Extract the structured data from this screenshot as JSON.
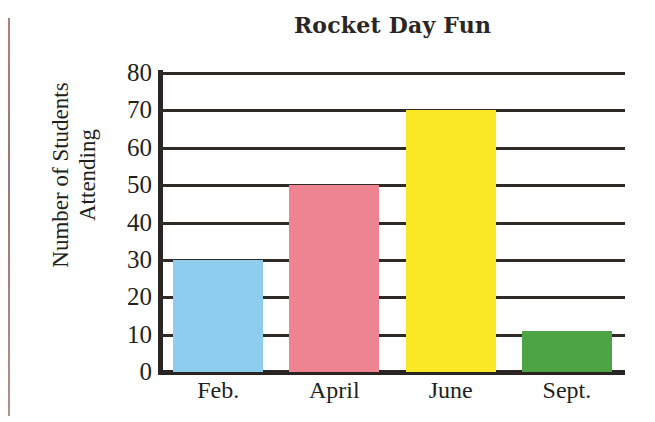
{
  "chart_data": {
    "type": "bar",
    "title": "Rocket Day Fun",
    "xlabel": "",
    "ylabel": "Number of Students Attending",
    "ylabel_lines": [
      "Number of Students",
      "Attending"
    ],
    "categories": [
      "Feb.",
      "April",
      "June",
      "Sept."
    ],
    "values": [
      30,
      50,
      70,
      11
    ],
    "bar_colors": [
      "#8ECDED",
      "#EE8491",
      "#FBE824",
      "#4DA444"
    ],
    "ylim": [
      0,
      80
    ],
    "ytick_step": 10,
    "ytick_labels": [
      "80",
      "70",
      "60",
      "50",
      "40",
      "30",
      "20",
      "10",
      "0"
    ],
    "ytick_values": [
      80,
      70,
      60,
      50,
      40,
      30,
      20,
      10,
      0
    ],
    "grid": true,
    "grid_orientation": "horizontal",
    "legend": false,
    "series": [
      {
        "name": "Number of Students Attending",
        "values": [
          30,
          50,
          70,
          11
        ]
      }
    ]
  },
  "axis_color": "#2a2522",
  "gridline_color": "#2f2a26",
  "text_color": "#231f1c",
  "margin_rule_color": "#9f6b63"
}
